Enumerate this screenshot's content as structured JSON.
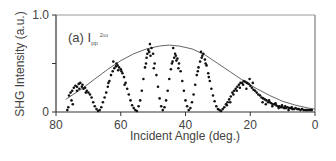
{
  "chart_data": {
    "type": "scatter",
    "title": "",
    "panel_label": "(a) I",
    "panel_subscript": "pp",
    "panel_superscript": "2ω",
    "xlabel": "Incident Angle (deg.)",
    "ylabel": "SHG Intensity (a.u.)",
    "xlim": [
      80,
      0
    ],
    "ylim": [
      0,
      1.0
    ],
    "x_ticks": [
      80,
      60,
      40,
      20,
      0
    ],
    "y_ticks": [
      0,
      0.5,
      1.0
    ],
    "y_tick_labels": [
      "0",
      "",
      "1.0"
    ],
    "grid": false,
    "legend": null,
    "series": [
      {
        "name": "measured",
        "style": "markers",
        "color": "#111111",
        "points": [
          [
            76,
            0.17
          ],
          [
            75.5,
            0.2
          ],
          [
            75,
            0.22
          ],
          [
            74.5,
            0.25
          ],
          [
            74,
            0.27
          ],
          [
            73.5,
            0.26
          ],
          [
            73,
            0.29
          ],
          [
            72.5,
            0.3
          ],
          [
            72,
            0.26
          ],
          [
            71.5,
            0.24
          ],
          [
            71,
            0.25
          ],
          [
            70.5,
            0.22
          ],
          [
            70,
            0.2
          ],
          [
            69.5,
            0.18
          ],
          [
            69,
            0.15
          ],
          [
            68.5,
            0.1
          ],
          [
            68,
            0.06
          ],
          [
            67.5,
            0.03
          ],
          [
            67,
            0.01
          ],
          [
            66.5,
            0.02
          ],
          [
            66,
            0.05
          ],
          [
            73.5,
            0.22
          ],
          [
            72.8,
            0.24
          ],
          [
            71.8,
            0.28
          ],
          [
            70.8,
            0.2
          ],
          [
            75.2,
            0.12
          ],
          [
            74.8,
            0.08
          ],
          [
            76.2,
            0.05
          ],
          [
            76.5,
            0.02
          ],
          [
            65.5,
            0.1
          ],
          [
            65,
            0.15
          ],
          [
            64.5,
            0.2
          ],
          [
            64,
            0.26
          ],
          [
            63.5,
            0.32
          ],
          [
            63,
            0.38
          ],
          [
            62.5,
            0.42
          ],
          [
            62,
            0.45
          ],
          [
            61.5,
            0.47
          ],
          [
            61,
            0.48
          ],
          [
            60.5,
            0.46
          ],
          [
            60,
            0.44
          ],
          [
            59.5,
            0.4
          ],
          [
            59,
            0.36
          ],
          [
            58.5,
            0.3
          ],
          [
            58,
            0.24
          ],
          [
            57.5,
            0.18
          ],
          [
            57,
            0.12
          ],
          [
            56.5,
            0.07
          ],
          [
            56,
            0.04
          ],
          [
            55.5,
            0.02
          ],
          [
            55,
            0.01
          ],
          [
            62.3,
            0.52
          ],
          [
            61.3,
            0.5
          ],
          [
            60.8,
            0.43
          ],
          [
            59.8,
            0.42
          ],
          [
            63.8,
            0.3
          ],
          [
            58.8,
            0.28
          ],
          [
            54.5,
            0.06
          ],
          [
            54,
            0.12
          ],
          [
            53.5,
            0.22
          ],
          [
            53,
            0.34
          ],
          [
            52.5,
            0.46
          ],
          [
            52,
            0.56
          ],
          [
            51.5,
            0.64
          ],
          [
            51,
            0.7
          ],
          [
            50.5,
            0.66
          ],
          [
            50,
            0.6
          ],
          [
            49.5,
            0.5
          ],
          [
            49,
            0.38
          ],
          [
            48.5,
            0.26
          ],
          [
            48,
            0.14
          ],
          [
            47.5,
            0.06
          ],
          [
            47,
            0.02
          ],
          [
            51.8,
            0.6
          ],
          [
            51.2,
            0.62
          ],
          [
            50.8,
            0.58
          ],
          [
            52.2,
            0.5
          ],
          [
            49.8,
            0.45
          ],
          [
            46.5,
            0.05
          ],
          [
            46,
            0.12
          ],
          [
            45.5,
            0.22
          ],
          [
            45,
            0.34
          ],
          [
            44.5,
            0.44
          ],
          [
            44,
            0.52
          ],
          [
            43.5,
            0.56
          ],
          [
            43,
            0.58
          ],
          [
            42.5,
            0.55
          ],
          [
            42,
            0.5
          ],
          [
            41.5,
            0.42
          ],
          [
            41,
            0.32
          ],
          [
            40.5,
            0.22
          ],
          [
            40,
            0.12
          ],
          [
            39.5,
            0.06
          ],
          [
            39,
            0.02
          ],
          [
            43.8,
            0.66
          ],
          [
            43.2,
            0.6
          ],
          [
            42.8,
            0.53
          ],
          [
            44.2,
            0.5
          ],
          [
            42.2,
            0.45
          ],
          [
            38.5,
            0.04
          ],
          [
            38,
            0.1
          ],
          [
            37.5,
            0.18
          ],
          [
            37,
            0.28
          ],
          [
            36.5,
            0.38
          ],
          [
            36,
            0.46
          ],
          [
            35.5,
            0.52
          ],
          [
            35,
            0.56
          ],
          [
            34.5,
            0.6
          ],
          [
            34,
            0.54
          ],
          [
            33.5,
            0.48
          ],
          [
            33,
            0.4
          ],
          [
            32.5,
            0.32
          ],
          [
            32,
            0.24
          ],
          [
            31.5,
            0.17
          ],
          [
            31,
            0.11
          ],
          [
            30.5,
            0.06
          ],
          [
            30,
            0.03
          ],
          [
            29.5,
            0.02
          ],
          [
            29,
            0.01
          ],
          [
            35.2,
            0.62
          ],
          [
            34.8,
            0.58
          ],
          [
            33.8,
            0.5
          ],
          [
            32.8,
            0.36
          ],
          [
            36.2,
            0.42
          ],
          [
            28.5,
            0.03
          ],
          [
            28,
            0.05
          ],
          [
            27.5,
            0.08
          ],
          [
            27,
            0.1
          ],
          [
            26.5,
            0.13
          ],
          [
            26,
            0.16
          ],
          [
            25.5,
            0.2
          ],
          [
            25,
            0.22
          ],
          [
            24.5,
            0.24
          ],
          [
            24,
            0.26
          ],
          [
            23.5,
            0.28
          ],
          [
            23,
            0.3
          ],
          [
            22.5,
            0.3
          ],
          [
            22,
            0.32
          ],
          [
            21.5,
            0.31
          ],
          [
            21,
            0.3
          ],
          [
            20.5,
            0.29
          ],
          [
            20,
            0.27
          ],
          [
            19.5,
            0.25
          ],
          [
            19,
            0.23
          ],
          [
            18.5,
            0.22
          ],
          [
            18,
            0.2
          ],
          [
            17.5,
            0.18
          ],
          [
            25.2,
            0.18
          ],
          [
            24.2,
            0.22
          ],
          [
            23.2,
            0.25
          ],
          [
            22.2,
            0.28
          ],
          [
            21.2,
            0.24
          ],
          [
            20.2,
            0.34
          ],
          [
            19.2,
            0.3
          ],
          [
            27.2,
            0.07
          ],
          [
            26.2,
            0.1
          ],
          [
            17,
            0.17
          ],
          [
            16.5,
            0.15
          ],
          [
            16,
            0.14
          ],
          [
            15.5,
            0.13
          ],
          [
            15,
            0.12
          ],
          [
            14.5,
            0.1
          ],
          [
            14,
            0.1
          ],
          [
            13.5,
            0.09
          ],
          [
            13,
            0.08
          ],
          [
            12.5,
            0.08
          ],
          [
            12,
            0.07
          ],
          [
            11.5,
            0.06
          ],
          [
            11,
            0.06
          ],
          [
            10.5,
            0.05
          ],
          [
            10,
            0.05
          ],
          [
            9.5,
            0.04
          ],
          [
            9,
            0.04
          ],
          [
            8.5,
            0.05
          ],
          [
            8,
            0.04
          ],
          [
            7.5,
            0.04
          ],
          [
            7,
            0.03
          ],
          [
            6.5,
            0.03
          ],
          [
            6,
            0.04
          ],
          [
            5.5,
            0.03
          ],
          [
            5,
            0.03
          ],
          [
            4.5,
            0.02
          ],
          [
            4,
            0.03
          ],
          [
            3.5,
            0.02
          ],
          [
            3,
            0.02
          ],
          [
            2.5,
            0.02
          ],
          [
            2,
            0.02
          ],
          [
            1.5,
            0.02
          ],
          [
            1,
            0.02
          ],
          [
            16.2,
            0.1
          ],
          [
            15.2,
            0.08
          ],
          [
            14.2,
            0.12
          ],
          [
            13.2,
            0.06
          ],
          [
            12.2,
            0.09
          ],
          [
            11.2,
            0.04
          ],
          [
            10.2,
            0.07
          ],
          [
            9.2,
            0.06
          ],
          [
            8.2,
            0.02
          ],
          [
            7.2,
            0.05
          ]
        ]
      },
      {
        "name": "envelope",
        "style": "line",
        "color": "#555555",
        "points": [
          [
            77,
            0.13
          ],
          [
            72,
            0.24
          ],
          [
            68,
            0.34
          ],
          [
            64,
            0.44
          ],
          [
            60,
            0.53
          ],
          [
            56,
            0.6
          ],
          [
            52,
            0.65
          ],
          [
            48,
            0.68
          ],
          [
            45,
            0.69
          ],
          [
            42,
            0.68
          ],
          [
            38,
            0.65
          ],
          [
            34,
            0.59
          ],
          [
            30,
            0.5
          ],
          [
            26,
            0.41
          ],
          [
            22,
            0.32
          ],
          [
            18,
            0.24
          ],
          [
            14,
            0.17
          ],
          [
            10,
            0.11
          ],
          [
            6,
            0.07
          ],
          [
            2,
            0.04
          ],
          [
            0,
            0.03
          ]
        ]
      }
    ]
  }
}
